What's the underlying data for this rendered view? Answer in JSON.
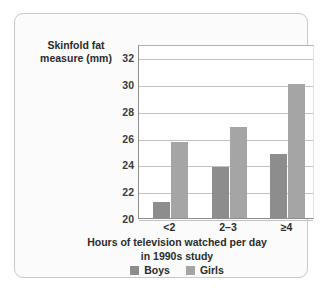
{
  "chart_data": {
    "type": "bar",
    "title": "",
    "categories": [
      "<2",
      "2–3",
      "≥4"
    ],
    "series": [
      {
        "name": "Boys",
        "color": "#8d8d8d",
        "values": [
          21.2,
          23.8,
          24.8
        ]
      },
      {
        "name": "Girls",
        "color": "#a5a5a5",
        "values": [
          25.7,
          26.8,
          30.0
        ]
      }
    ],
    "xlabel": "Hours of television watched per day in 1990s study",
    "ylabel": "Skinfold fat measure (mm)",
    "ylim": [
      20,
      33
    ],
    "yticks": [
      20,
      22,
      24,
      26,
      28,
      30,
      32
    ],
    "grid": "horizontal",
    "legend_position": "bottom-center"
  },
  "axes": {
    "y_title_line1": "Skinfold fat",
    "y_title_line2": "measure (mm)",
    "x_title_line1": "Hours of television watched per day",
    "x_title_line2": "in 1990s study"
  },
  "legend": {
    "items": [
      {
        "label": "Boys",
        "color": "#8d8d8d"
      },
      {
        "label": "Girls",
        "color": "#a5a5a5"
      }
    ]
  }
}
